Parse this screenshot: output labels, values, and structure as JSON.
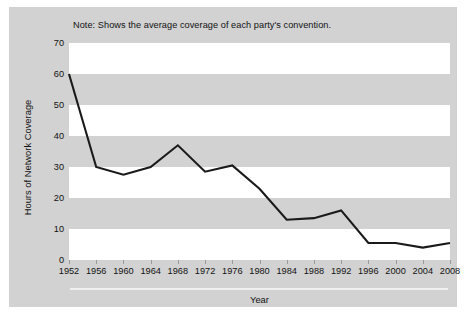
{
  "note": "Note: Shows the average coverage of each party's convention.",
  "colors": {
    "panel_background": "#d2d2d2",
    "band_light": "#ffffff",
    "line": "#1a1a1a",
    "text": "#111111",
    "figure_background": "#ffffff",
    "axis_rule": "#f0f0f0"
  },
  "chart_data": {
    "type": "line",
    "title": "",
    "subtitle": "",
    "annotations": [
      "Note: Shows the average coverage of each party's convention."
    ],
    "xlabel": "Year",
    "ylabel": "Hours of Network Coverage",
    "xlim": [
      1952,
      2008
    ],
    "ylim": [
      0,
      70
    ],
    "ytick_labels": [
      "0",
      "10",
      "20",
      "30",
      "40",
      "50",
      "60",
      "70"
    ],
    "ytick_values": [
      0,
      10,
      20,
      30,
      40,
      50,
      60,
      70
    ],
    "xtick_labels": [
      "1952",
      "1956",
      "1960",
      "1964",
      "1968",
      "1972",
      "1976",
      "1980",
      "1984",
      "1988",
      "1992",
      "1996",
      "2000",
      "2004",
      "2008"
    ],
    "categories": [
      1952,
      1956,
      1960,
      1964,
      1968,
      1972,
      1976,
      1980,
      1984,
      1988,
      1992,
      1996,
      2000,
      2004,
      2008
    ],
    "values": [
      60,
      30,
      27.5,
      30,
      37,
      28.5,
      30.5,
      23,
      13,
      13.5,
      16,
      5.5,
      5.5,
      4,
      5.5
    ],
    "series": [
      {
        "name": "Hours of Network Coverage",
        "values": [
          60,
          30,
          27.5,
          30,
          37,
          28.5,
          30.5,
          23,
          13,
          13.5,
          16,
          5.5,
          5.5,
          4,
          5.5
        ]
      }
    ],
    "grid": false,
    "banded_background": true,
    "band_ranges": [
      [
        0,
        10
      ],
      [
        20,
        30
      ],
      [
        40,
        50
      ],
      [
        60,
        70
      ]
    ],
    "legend": null,
    "legend_position": "none"
  }
}
